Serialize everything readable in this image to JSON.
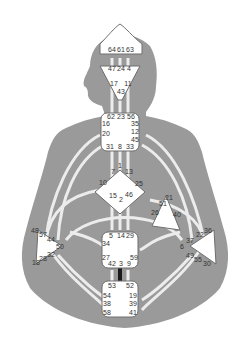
{
  "diagram": {
    "type": "human-design-bodygraph",
    "colors": {
      "silhouette": "#9a9a9a",
      "center_fill": "#ffffff",
      "center_stroke": "#6e6e6e",
      "channel": "#ececec",
      "active_channel": "#1a1a1a",
      "text": "#333333"
    },
    "centers": {
      "head": {
        "gates": [
          "64",
          "61",
          "63"
        ]
      },
      "ajna": {
        "gates": [
          "47",
          "24",
          "4",
          "17",
          "11",
          "43"
        ]
      },
      "throat": {
        "gates": [
          "62",
          "23",
          "56",
          "16",
          "35",
          "20",
          "12",
          "45",
          "31",
          "8",
          "33"
        ]
      },
      "g": {
        "gates": [
          "1",
          "7",
          "13",
          "10",
          "25",
          "15",
          "2",
          "46"
        ]
      },
      "heart": {
        "gates": [
          "21",
          "51",
          "26",
          "40"
        ]
      },
      "spleen": {
        "gates": [
          "48",
          "57",
          "44",
          "50",
          "32",
          "28",
          "18"
        ]
      },
      "solar_plexus": {
        "gates": [
          "36",
          "22",
          "37",
          "6",
          "49",
          "55",
          "30"
        ]
      },
      "sacral": {
        "gates": [
          "5",
          "14",
          "29",
          "34",
          "27",
          "59",
          "42",
          "3",
          "9"
        ]
      },
      "root": {
        "gates": [
          "53",
          "60",
          "52",
          "54",
          "19",
          "38",
          "39",
          "58",
          "41"
        ]
      }
    },
    "active_channel": "3-60"
  }
}
